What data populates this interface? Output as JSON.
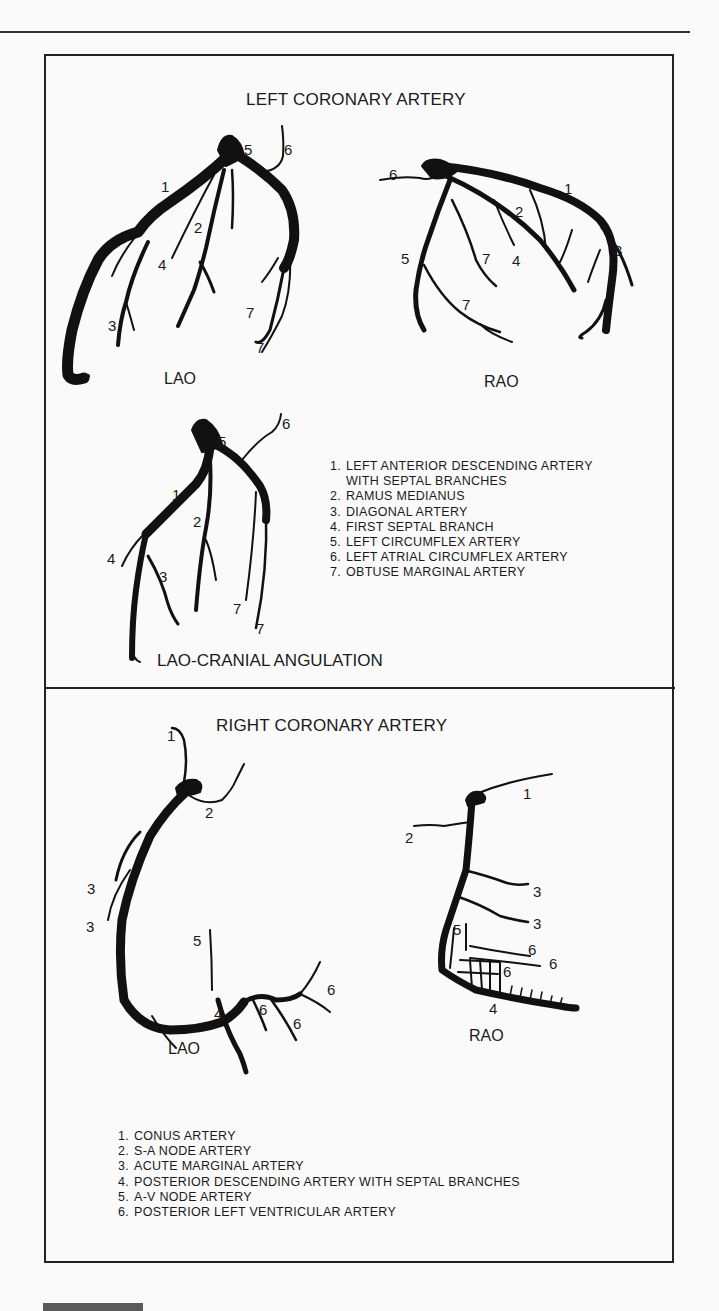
{
  "left_panel": {
    "title": "LEFT CORONARY ARTERY",
    "views": {
      "lao": {
        "label": "LAO",
        "markers": [
          "1",
          "2",
          "3",
          "4",
          "5",
          "6",
          "7",
          "7"
        ]
      },
      "rao": {
        "label": "RAO",
        "markers": [
          "1",
          "2",
          "3",
          "4",
          "5",
          "6",
          "7",
          "7"
        ]
      },
      "lao_cranial": {
        "label": "LAO-CRANIAL ANGULATION",
        "markers": [
          "1",
          "2",
          "3",
          "4",
          "5",
          "6",
          "7",
          "7"
        ]
      }
    },
    "legend": [
      {
        "num": "1.",
        "text": "LEFT ANTERIOR DESCENDING ARTERY",
        "cont": "WITH SEPTAL BRANCHES"
      },
      {
        "num": "2.",
        "text": "RAMUS MEDIANUS"
      },
      {
        "num": "3.",
        "text": "DIAGONAL ARTERY"
      },
      {
        "num": "4.",
        "text": "FIRST SEPTAL BRANCH"
      },
      {
        "num": "5.",
        "text": "LEFT CIRCUMFLEX ARTERY"
      },
      {
        "num": "6.",
        "text": "LEFT ATRIAL CIRCUMFLEX ARTERY"
      },
      {
        "num": "7.",
        "text": "OBTUSE MARGINAL ARTERY"
      }
    ]
  },
  "right_panel": {
    "title": "RIGHT CORONARY ARTERY",
    "views": {
      "lao": {
        "label": "LAO",
        "markers": [
          "1",
          "2",
          "3",
          "3",
          "4",
          "5",
          "6",
          "6",
          "6"
        ]
      },
      "rao": {
        "label": "RAO",
        "markers": [
          "1",
          "2",
          "3",
          "3",
          "4",
          "5",
          "6",
          "6",
          "6"
        ]
      }
    },
    "legend": [
      {
        "num": "1.",
        "text": "CONUS ARTERY"
      },
      {
        "num": "2.",
        "text": "S-A NODE ARTERY"
      },
      {
        "num": "3.",
        "text": "ACUTE MARGINAL ARTERY"
      },
      {
        "num": "4.",
        "text": "POSTERIOR DESCENDING ARTERY WITH SEPTAL BRANCHES"
      },
      {
        "num": "5.",
        "text": "A-V NODE ARTERY"
      },
      {
        "num": "6.",
        "text": "POSTERIOR LEFT VENTRICULAR ARTERY"
      }
    ]
  },
  "colors": {
    "ink": "#1a1a1a",
    "paper": "#fafafa",
    "bar": "#5a5a5a"
  }
}
